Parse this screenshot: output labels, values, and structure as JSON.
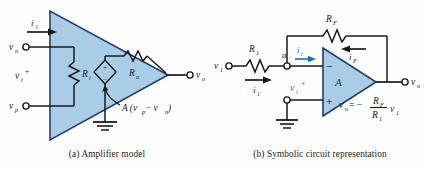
{
  "figure": {
    "background_color": "#fefefe",
    "amp_fill_color": "#a9cde6",
    "amp_stroke_color": "#1d3f6e",
    "wire_color": "#1a1a1a",
    "accent_blue": "#1f6fb4"
  },
  "panel_a": {
    "caption": "(a)  Amplifier model",
    "labels": {
      "input_current": "i",
      "input_current_sub": "i",
      "v_n": "v",
      "v_n_sub": "n",
      "v_i": "v",
      "v_i_sub": "i",
      "v_i_sup": "+",
      "v_p": "v",
      "v_p_sub": "p",
      "v_o": "v",
      "v_o_sub": "o",
      "R_i": "R",
      "R_i_sub": "i",
      "R_o": "R",
      "R_o_sub": "o",
      "source_expr": "A (v",
      "source_expr_sub1": "p",
      "source_expr_mid": " − v",
      "source_expr_sub2": "n",
      "source_expr_end": ")",
      "source_plus": "+",
      "source_minus": "−"
    }
  },
  "panel_b": {
    "caption": "(b)  Symbolic circuit representation",
    "labels": {
      "v_1": "v",
      "v_1_sub": "1",
      "R_1": "R",
      "R_1_sub": "1",
      "node_a": "a",
      "i_i": "i",
      "i_i_sub": "i",
      "i_1": "i",
      "i_1_sub": "1",
      "v_i": "v",
      "v_i_sub": "i",
      "v_i_sup": "+",
      "R_F": "R",
      "R_F_sub": "F",
      "i_F": "i",
      "i_F_sub": "F",
      "amp_gain": "A",
      "terminal_minus": "−",
      "terminal_plus": "+",
      "v_o": "v",
      "v_o_sub": "o",
      "equation_lhs": "v",
      "equation_lhs_sub": "o",
      "equation_eq": " = −",
      "equation_num": "R",
      "equation_num_sub": "F",
      "equation_den": "R",
      "equation_den_sub": "1",
      "equation_tail": "v",
      "equation_tail_sub": "1"
    }
  }
}
